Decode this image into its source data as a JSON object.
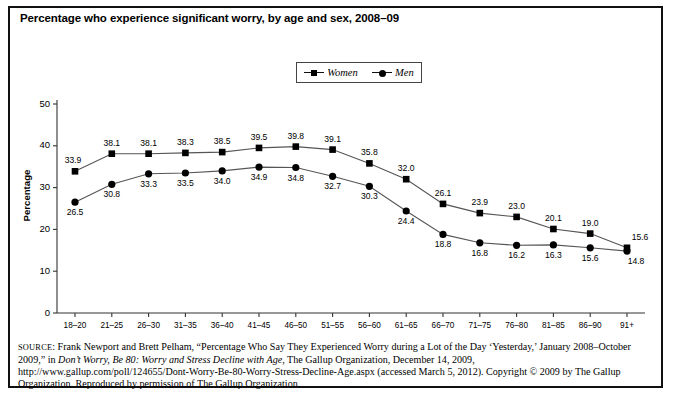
{
  "figure": {
    "title": "Percentage who experience significant worry, by age and sex, 2008–09",
    "ylabel": "Percentage"
  },
  "legend": {
    "position": "top-center",
    "entries": [
      {
        "label": "Women",
        "marker": "square",
        "color": "#000000"
      },
      {
        "label": "Men",
        "marker": "circle",
        "color": "#000000"
      }
    ]
  },
  "source": {
    "prefix": "SOURCE",
    "part1": ": Frank Newport and Brett Pelham, “Percentage Who Say They Experienced Worry during a Lot of the Day ‘Yesterday,’ January 2008–October 2009,” in ",
    "italic1": "Don’t Worry, Be 80: Worry and Stress Decline with Age",
    "part2": ", The Gallup Organization, December 14, 2009, http://www.gallup.com/poll/124655/Dont-Worry-Be-80-Worry-Stress-Decline-Age.aspx (accessed March 5, 2012). Copyright © 2009 by The Gallup Organization. Reproduced by permission of The Gallup Organization."
  },
  "chart_data": {
    "type": "line",
    "title": "Percentage who experience significant worry, by age and sex, 2008–09",
    "xlabel": "",
    "ylabel": "Percentage",
    "ylim": [
      0,
      50
    ],
    "yticks": [
      0,
      10,
      20,
      30,
      40,
      50
    ],
    "grid": false,
    "legend_position": "top-center",
    "categories": [
      "18–20",
      "21–25",
      "26–30",
      "31–35",
      "36–40",
      "41–45",
      "46–50",
      "51–55",
      "56–60",
      "61–65",
      "66–70",
      "71–75",
      "76–80",
      "81–85",
      "86–90",
      "91+"
    ],
    "series": [
      {
        "name": "Women",
        "marker": "square",
        "values": [
          33.9,
          38.1,
          38.1,
          38.3,
          38.5,
          39.5,
          39.8,
          39.1,
          35.8,
          32.0,
          26.1,
          23.9,
          23.0,
          20.1,
          19.0,
          15.6
        ]
      },
      {
        "name": "Men",
        "marker": "circle",
        "values": [
          26.5,
          30.8,
          33.3,
          33.5,
          34.0,
          34.9,
          34.8,
          32.7,
          30.3,
          24.4,
          18.8,
          16.8,
          16.2,
          16.3,
          15.6,
          14.8
        ]
      }
    ]
  }
}
